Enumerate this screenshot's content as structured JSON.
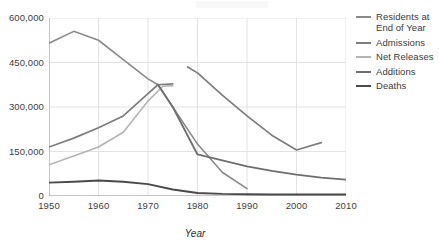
{
  "chart_data": {
    "type": "line",
    "title": "",
    "xlabel": "Year",
    "ylabel": "",
    "xlim": [
      1950,
      2010
    ],
    "ylim": [
      0,
      600000
    ],
    "grid": true,
    "legend_position": "right",
    "xticks": [
      "1950",
      "1960",
      "1970",
      "1980",
      "1990",
      "2000",
      "2010"
    ],
    "yticks": [
      "0",
      "150,000",
      "300,000",
      "450,000",
      "600,000"
    ],
    "ytick_values": [
      0,
      150000,
      300000,
      450000,
      600000
    ],
    "xtick_values": [
      1950,
      1960,
      1970,
      1980,
      1990,
      2000,
      2010
    ],
    "series": [
      {
        "name": "Residents at End of Year",
        "color": "#8a8a8a",
        "width": 1.6,
        "x": [
          1950,
          1955,
          1960,
          1965,
          1970,
          1972,
          1975,
          1980,
          1985,
          1990
        ],
        "values": [
          515000,
          555000,
          525000,
          460000,
          395000,
          375000,
          300000,
          175000,
          80000,
          25000
        ]
      },
      {
        "name": "Admissions",
        "color": "#7d7d7d",
        "width": 1.7,
        "segments": [
          {
            "x": [
              1950,
              1955,
              1960,
              1965,
              1970,
              1972,
              1975
            ],
            "values": [
              165000,
              195000,
              230000,
              270000,
              345000,
              375000,
              378000
            ]
          },
          {
            "x": [
              1978,
              1980,
              1985,
              1990,
              1995,
              2000,
              2005
            ],
            "values": [
              435000,
              415000,
              340000,
              270000,
              205000,
              155000,
              180000
            ]
          }
        ]
      },
      {
        "name": "Net Releases",
        "color": "#b4b4b4",
        "width": 1.6,
        "x": [
          1950,
          1955,
          1960,
          1965,
          1970,
          1973,
          1975
        ],
        "values": [
          105000,
          135000,
          165000,
          215000,
          320000,
          370000,
          372000
        ]
      },
      {
        "name": "Additions",
        "color": "#6e6e6e",
        "width": 1.8,
        "x": [
          1972,
          1975,
          1980,
          1985,
          1990,
          1995,
          2000,
          2005,
          2010
        ],
        "values": [
          376000,
          300000,
          140000,
          120000,
          100000,
          85000,
          72000,
          62000,
          55000
        ]
      },
      {
        "name": "Deaths",
        "color": "#4a4a4a",
        "width": 1.9,
        "x": [
          1950,
          1955,
          1960,
          1965,
          1970,
          1975,
          1980,
          1985,
          1990,
          1995,
          2000,
          2005,
          2010
        ],
        "values": [
          45000,
          48000,
          52000,
          48000,
          40000,
          22000,
          10000,
          7000,
          6000,
          5000,
          5000,
          5000,
          5000
        ]
      }
    ]
  },
  "legend": {
    "items": [
      {
        "label": "Residents at End of Year",
        "color": "#8a8a8a"
      },
      {
        "label": "Admissions",
        "color": "#7d7d7d"
      },
      {
        "label": "Net Releases",
        "color": "#b4b4b4"
      },
      {
        "label": "Additions",
        "color": "#6e6e6e"
      },
      {
        "label": "Deaths",
        "color": "#4a4a4a"
      }
    ]
  },
  "axes": {
    "x_title": "Year"
  },
  "style": {
    "grid_color": "#e2e2e2",
    "axis_color": "#8d8d8d",
    "background": "#ffffff"
  }
}
